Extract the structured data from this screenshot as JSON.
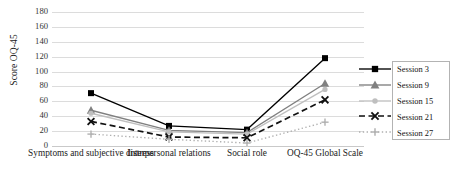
{
  "chart_data": {
    "type": "line",
    "title": "",
    "xlabel": "",
    "ylabel": "Score OQ-45",
    "categories": [
      "Symptoms and subjective distress",
      "Interpersonal relations",
      "Social role",
      "OQ-45 Global Scale"
    ],
    "ylim": [
      0,
      180
    ],
    "ytick_step": 20,
    "yticks": [
      "180",
      "160",
      "140",
      "120",
      "100",
      "80",
      "60",
      "40",
      "20",
      "0"
    ],
    "grid": true,
    "legend_position": "right",
    "series": [
      {
        "name": "Session 3",
        "values": [
          71,
          27,
          22,
          118
        ],
        "color": "#000000",
        "marker": "square",
        "dash": "solid"
      },
      {
        "name": "Session 9",
        "values": [
          48,
          21,
          18,
          84
        ],
        "color": "#808080",
        "marker": "triangle",
        "dash": "solid"
      },
      {
        "name": "Session 15",
        "values": [
          44,
          19,
          16,
          76
        ],
        "color": "#bfbfbf",
        "marker": "circle",
        "dash": "solid"
      },
      {
        "name": "Session 21",
        "values": [
          33,
          12,
          11,
          62
        ],
        "color": "#111111",
        "marker": "x",
        "dash": "dashed"
      },
      {
        "name": "Session 27",
        "values": [
          16,
          9,
          4,
          32
        ],
        "color": "#b0b0b0",
        "marker": "plus",
        "dash": "dotted"
      }
    ]
  },
  "legend": {
    "items": [
      {
        "label": "Session 3"
      },
      {
        "label": "Session 9"
      },
      {
        "label": "Session 15"
      },
      {
        "label": "Session 21"
      },
      {
        "label": "Session 27"
      }
    ]
  },
  "colors": {
    "gridline": "#dcdcdc",
    "axis": "#c9c9c9",
    "text": "#1a1a1a",
    "legend_border": "#b3b3b3"
  }
}
